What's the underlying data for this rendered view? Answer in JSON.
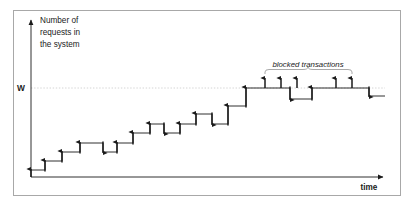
{
  "figure": {
    "frame": {
      "x": 13,
      "y": 10,
      "width": 388,
      "height": 186,
      "border_color": "#a8a8a8"
    },
    "background": "#ffffff",
    "ink_color": "#1a1a1a",
    "threshold_line_color": "#c9c9c9"
  },
  "axes": {
    "y_label_lines": [
      "Number of",
      "requests in",
      "the system"
    ],
    "x_label": "time",
    "origin": {
      "x": 31,
      "y": 177
    },
    "y_axis_top": {
      "x": 31,
      "y": 18
    },
    "x_axis_right": {
      "x": 385,
      "y": 177
    }
  },
  "threshold": {
    "label": "W",
    "label_x": 21,
    "y": 88,
    "line_from_x": 31,
    "line_to_x": 385,
    "style": "dotted"
  },
  "annotation": {
    "label": "blocked transactions",
    "label_x": 308,
    "label_y": 66,
    "brace": {
      "from_x": 265,
      "to_x": 352,
      "y": 74,
      "peak_x": 308
    }
  },
  "chart_data": {
    "type": "line",
    "title": "",
    "xlabel": "time",
    "ylabel": "Number of requests in the system",
    "subtype": "step-function",
    "grid": false,
    "legend": "none",
    "xlim": [
      31,
      385
    ],
    "ylim_pixels": [
      177,
      18
    ],
    "threshold_label": "W",
    "threshold_y_pixel": 88,
    "steps": [
      {
        "x": 31,
        "y": 170,
        "dir": "start",
        "arrow": true,
        "arrow_dir": "up"
      },
      {
        "x": 45,
        "y": 170,
        "dir": "up",
        "arrow": true,
        "arrow_dir": "up"
      },
      {
        "x": 45,
        "y": 161,
        "dir": "flat",
        "arrow": false
      },
      {
        "x": 62,
        "y": 161,
        "dir": "up",
        "arrow": true,
        "arrow_dir": "up"
      },
      {
        "x": 62,
        "y": 152,
        "dir": "flat",
        "arrow": false
      },
      {
        "x": 80,
        "y": 152,
        "dir": "up",
        "arrow": true,
        "arrow_dir": "up"
      },
      {
        "x": 80,
        "y": 143,
        "dir": "flat",
        "arrow": false
      },
      {
        "x": 103,
        "y": 143,
        "dir": "down",
        "arrow": true,
        "arrow_dir": "down"
      },
      {
        "x": 103,
        "y": 152,
        "dir": "flat",
        "arrow": false
      },
      {
        "x": 117,
        "y": 152,
        "dir": "up",
        "arrow": true,
        "arrow_dir": "up"
      },
      {
        "x": 117,
        "y": 143,
        "dir": "flat",
        "arrow": false
      },
      {
        "x": 133,
        "y": 143,
        "dir": "up",
        "arrow": true,
        "arrow_dir": "up"
      },
      {
        "x": 133,
        "y": 133,
        "dir": "flat",
        "arrow": false
      },
      {
        "x": 150,
        "y": 133,
        "dir": "up",
        "arrow": true,
        "arrow_dir": "up"
      },
      {
        "x": 150,
        "y": 124,
        "dir": "flat",
        "arrow": false
      },
      {
        "x": 164,
        "y": 124,
        "dir": "down",
        "arrow": true,
        "arrow_dir": "down"
      },
      {
        "x": 164,
        "y": 133,
        "dir": "flat",
        "arrow": false
      },
      {
        "x": 180,
        "y": 133,
        "dir": "up",
        "arrow": true,
        "arrow_dir": "up"
      },
      {
        "x": 180,
        "y": 124,
        "dir": "flat",
        "arrow": false
      },
      {
        "x": 196,
        "y": 124,
        "dir": "up",
        "arrow": true,
        "arrow_dir": "up"
      },
      {
        "x": 196,
        "y": 114,
        "dir": "flat",
        "arrow": false
      },
      {
        "x": 212,
        "y": 114,
        "dir": "down",
        "arrow": true,
        "arrow_dir": "down"
      },
      {
        "x": 212,
        "y": 124,
        "dir": "flat",
        "arrow": false
      },
      {
        "x": 228,
        "y": 124,
        "dir": "up",
        "arrow": true,
        "arrow_dir": "up"
      },
      {
        "x": 228,
        "y": 106,
        "dir": "flat",
        "arrow": false
      },
      {
        "x": 246,
        "y": 106,
        "dir": "up",
        "arrow": true,
        "arrow_dir": "up"
      },
      {
        "x": 246,
        "y": 88,
        "dir": "flat",
        "arrow": false
      },
      {
        "x": 290,
        "y": 88,
        "dir": "down",
        "arrow": true,
        "arrow_dir": "down"
      },
      {
        "x": 290,
        "y": 99,
        "dir": "flat",
        "arrow": false
      },
      {
        "x": 312,
        "y": 99,
        "dir": "up",
        "arrow": true,
        "arrow_dir": "up"
      },
      {
        "x": 312,
        "y": 88,
        "dir": "flat",
        "arrow": false
      },
      {
        "x": 369,
        "y": 88,
        "dir": "down",
        "arrow": true,
        "arrow_dir": "down"
      },
      {
        "x": 369,
        "y": 96,
        "dir": "flat",
        "arrow": false
      },
      {
        "x": 385,
        "y": 96,
        "dir": "end",
        "arrow": false
      }
    ],
    "blocked_arrows": [
      {
        "x": 265,
        "y_top": 78,
        "y_base": 88
      },
      {
        "x": 281,
        "y_top": 78,
        "y_base": 88
      },
      {
        "x": 297,
        "y_top": 78,
        "y_base": 88
      },
      {
        "x": 336,
        "y_top": 78,
        "y_base": 88
      },
      {
        "x": 352,
        "y_top": 78,
        "y_base": 88
      }
    ]
  }
}
